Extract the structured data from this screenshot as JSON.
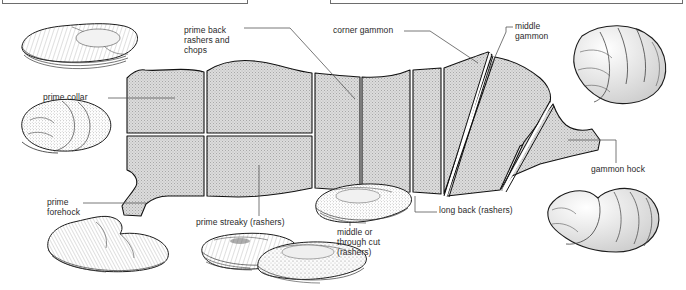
{
  "figure": {
    "kind": "pork-bacon-cuts-diagram",
    "title_visible": false,
    "background": "#ffffff",
    "cut_fill": "#d9d9d9",
    "outline_color": "#1a1a1a",
    "leader_color": "#4a4a4a"
  },
  "top_boxes": [
    {
      "name": "left-truncated-box"
    },
    {
      "name": "right-truncated-box"
    }
  ],
  "labels": {
    "prime_back": "prime back\nrashers and\nchops",
    "corner_gammon": "corner gammon",
    "middle_gammon": "middle\ngammon",
    "prime_collar": "prime collar",
    "prime_forehock": "prime\nforehock",
    "prime_streaky": "prime streaky (rashers)",
    "middle_cut": "middle or\nthrough cut\n(rashers)",
    "long_back": "long back (rashers)",
    "gammon_hock": "gammon hock"
  },
  "cuts": [
    {
      "id": "prime-collar",
      "label": "prime collar",
      "position": "upper-left"
    },
    {
      "id": "prime-back",
      "label": "prime back rashers and chops",
      "position": "upper-middle-left"
    },
    {
      "id": "long-back",
      "label": "long back (rashers)",
      "position": "upper-middle-right"
    },
    {
      "id": "corner-gammon",
      "label": "corner gammon",
      "position": "upper-right"
    },
    {
      "id": "middle-gammon",
      "label": "middle gammon",
      "position": "right"
    },
    {
      "id": "gammon-hock",
      "label": "gammon hock",
      "position": "far-right"
    },
    {
      "id": "prime-forehock",
      "label": "prime forehock",
      "position": "lower-left"
    },
    {
      "id": "prime-streaky",
      "label": "prime streaky (rashers)",
      "position": "lower-middle"
    },
    {
      "id": "middle-cut",
      "label": "middle or through cut (rashers)",
      "position": "lower-middle-right"
    }
  ],
  "illustrations": [
    {
      "id": "illus-prime-back",
      "for": "prime back rashers and chops",
      "position": "top-left"
    },
    {
      "id": "illus-prime-collar",
      "for": "prime collar",
      "position": "left"
    },
    {
      "id": "illus-prime-forehock",
      "for": "prime forehock",
      "position": "bottom-left"
    },
    {
      "id": "illus-prime-streaky",
      "for": "prime streaky (rashers)",
      "position": "bottom-middle"
    },
    {
      "id": "illus-middle-cut",
      "for": "middle or through cut (rashers)",
      "position": "bottom-centre"
    },
    {
      "id": "illus-long-back",
      "for": "long back (rashers)",
      "position": "bottom-right"
    },
    {
      "id": "illus-middle-gammon",
      "for": "middle gammon",
      "position": "top-right"
    },
    {
      "id": "illus-gammon-hock",
      "for": "gammon hock",
      "position": "right"
    }
  ]
}
